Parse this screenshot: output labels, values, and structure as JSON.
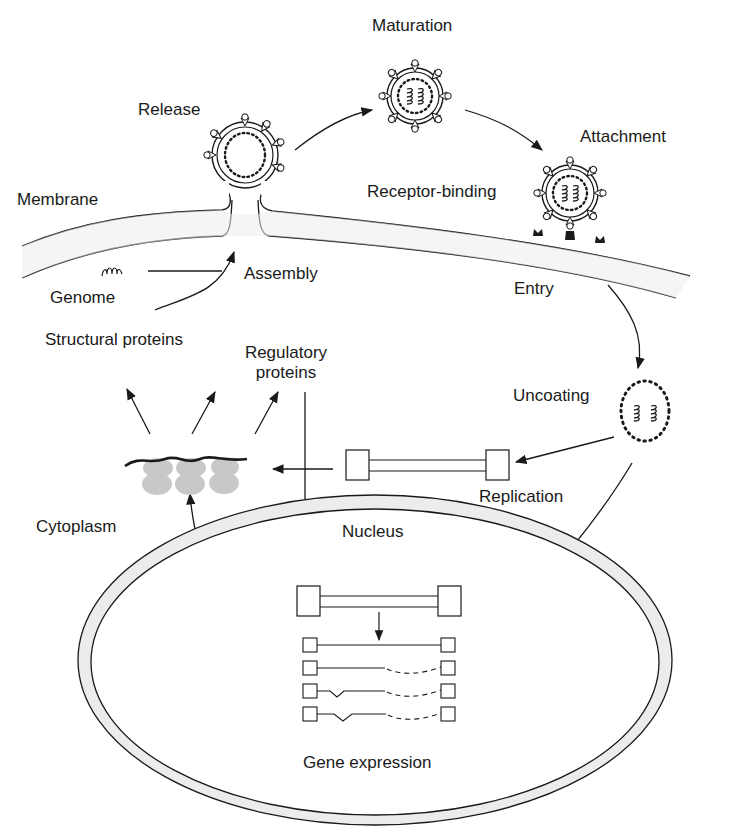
{
  "diagram": {
    "colors": {
      "ink": "#1a1a1a",
      "membrane_fill": "#ececec",
      "ribosome_fill": "#c8c8c8",
      "background": "#ffffff"
    },
    "labels": {
      "maturation": "Maturation",
      "release": "Release",
      "attachment": "Attachment",
      "membrane": "Membrane",
      "receptor_binding": "Receptor-binding",
      "genome": "Genome",
      "assembly": "Assembly",
      "entry": "Entry",
      "structural_proteins": "Structural proteins",
      "regulatory_proteins_line1": "Regulatory",
      "regulatory_proteins_line2": "proteins",
      "uncoating": "Uncoating",
      "replication": "Replication",
      "cytoplasm": "Cytoplasm",
      "nucleus": "Nucleus",
      "gene_expression": "Gene expression"
    },
    "stages": [
      "Attachment",
      "Receptor-binding",
      "Entry",
      "Uncoating",
      "Replication",
      "Gene expression",
      "Structural proteins",
      "Regulatory proteins",
      "Assembly",
      "Release",
      "Maturation"
    ],
    "compartments": [
      "Membrane",
      "Cytoplasm",
      "Nucleus"
    ],
    "transcripts": [
      {
        "type": "unspliced"
      },
      {
        "type": "dashed-3prime"
      },
      {
        "type": "spliced-dashed"
      },
      {
        "type": "spliced-dashed"
      }
    ]
  }
}
